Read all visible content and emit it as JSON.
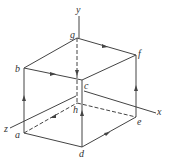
{
  "diagram": {
    "type": "cube-current-loop",
    "axes": {
      "x": "x",
      "y": "y",
      "z": "z"
    },
    "vertices": {
      "a": "a",
      "b": "b",
      "c": "c",
      "d": "d",
      "e": "e",
      "f": "f",
      "g": "g",
      "h": "h"
    },
    "colors": {
      "line": "#444444",
      "background": "#ffffff"
    }
  }
}
